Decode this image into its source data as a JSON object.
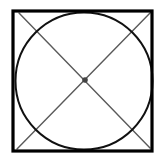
{
  "diagram": {
    "type": "geometric-figure",
    "colors": {
      "background": "#ffffff",
      "square_stroke": "#000000",
      "circle_stroke": "#111111",
      "diagonal_stroke": "#5a5a5a",
      "center_point": "#444444"
    },
    "square": {
      "x": 13,
      "y": 11,
      "width": 139,
      "height": 140,
      "stroke_width": 3.2
    },
    "circle": {
      "cx": 84,
      "cy": 81,
      "r": 68.5,
      "stroke_width": 2
    },
    "diagonals": [
      {
        "name": "top-left-to-bottom-right",
        "x1": 19,
        "y1": 13,
        "x2": 150,
        "y2": 148
      },
      {
        "name": "top-right-to-bottom-left",
        "x1": 151,
        "y1": 12,
        "x2": 17,
        "y2": 149
      }
    ],
    "center_point": {
      "cx": 85,
      "cy": 80,
      "r": 2.8
    }
  }
}
